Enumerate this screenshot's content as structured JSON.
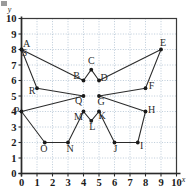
{
  "chart_data": {
    "type": "scatter",
    "title": "",
    "xlabel": "x",
    "ylabel": "y",
    "xlim": [
      0,
      10
    ],
    "ylim": [
      0,
      10
    ],
    "grid": true,
    "legend": "none",
    "x_ticks": [
      "0",
      "1",
      "2",
      "3",
      "4",
      "5",
      "6",
      "7",
      "8",
      "9",
      "10"
    ],
    "y_ticks": [
      "0",
      "1",
      "2",
      "3",
      "4",
      "5",
      "6",
      "7",
      "8",
      "9",
      "10"
    ],
    "points": [
      {
        "label": "A",
        "x": 0,
        "y": 8
      },
      {
        "label": "B",
        "x": 4,
        "y": 6
      },
      {
        "label": "C",
        "x": 4.5,
        "y": 6.7
      },
      {
        "label": "D",
        "x": 5,
        "y": 6
      },
      {
        "label": "E",
        "x": 9,
        "y": 8
      },
      {
        "label": "F",
        "x": 8,
        "y": 5.5
      },
      {
        "label": "G",
        "x": 5,
        "y": 5
      },
      {
        "label": "H",
        "x": 8,
        "y": 4
      },
      {
        "label": "I",
        "x": 7.5,
        "y": 2
      },
      {
        "label": "J",
        "x": 6,
        "y": 2
      },
      {
        "label": "K",
        "x": 5,
        "y": 4
      },
      {
        "label": "L",
        "x": 4.5,
        "y": 3.4
      },
      {
        "label": "M",
        "x": 4,
        "y": 4
      },
      {
        "label": "N",
        "x": 3,
        "y": 2
      },
      {
        "label": "O",
        "x": 1.5,
        "y": 2
      },
      {
        "label": "P",
        "x": 0,
        "y": 4
      },
      {
        "label": "Q",
        "x": 4,
        "y": 5
      },
      {
        "label": "R",
        "x": 1,
        "y": 5.5
      },
      {
        "label": "S",
        "x": 0,
        "y": 8
      }
    ],
    "path_order": [
      "A",
      "B",
      "C",
      "D",
      "E",
      "F",
      "G",
      "H",
      "I",
      "J",
      "K",
      "L",
      "M",
      "N",
      "O",
      "P",
      "Q",
      "R",
      "S"
    ],
    "closed": true
  },
  "axes": {
    "x_axis_label": "x",
    "y_axis_label": "y"
  }
}
